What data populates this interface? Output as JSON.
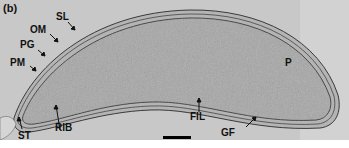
{
  "figure": {
    "panel_label": "(b)",
    "image_type": "electron micrograph of a bacterial cell (cross-section)",
    "labels": [
      {
        "id": "SL",
        "text": "SL"
      },
      {
        "id": "OM",
        "text": "OM"
      },
      {
        "id": "PG",
        "text": "PG"
      },
      {
        "id": "PM",
        "text": "PM"
      },
      {
        "id": "ST",
        "text": "ST"
      },
      {
        "id": "RIB",
        "text": "RIB"
      },
      {
        "id": "FIL",
        "text": "FIL"
      },
      {
        "id": "GF",
        "text": "GF"
      },
      {
        "id": "P",
        "text": "P"
      }
    ],
    "scale_bar": {
      "text": ""
    },
    "colors": {
      "background": "#c9c9c9",
      "cytoplasm": "#a8a8a8",
      "membrane": "#3a3a3a",
      "label": "#111111"
    }
  }
}
